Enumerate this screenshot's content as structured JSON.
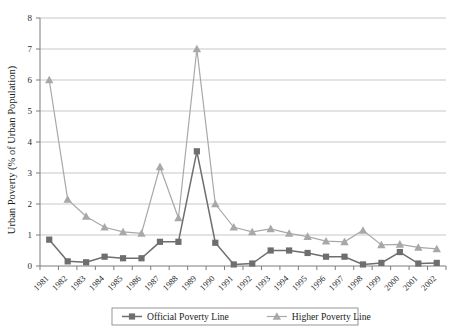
{
  "chart_data": {
    "type": "line",
    "title": "",
    "xlabel": "",
    "ylabel": "Urban Poverty (% of Urban Population)",
    "ylim": [
      0,
      8
    ],
    "ytick_labels": [
      "0",
      "1",
      "2",
      "3",
      "4",
      "5",
      "6",
      "7",
      "8"
    ],
    "grid": true,
    "legend_position": "bottom",
    "categories": [
      "1981",
      "1982",
      "1983",
      "1984",
      "1985",
      "1986",
      "1987",
      "1988",
      "1989",
      "1990",
      "1991",
      "1992",
      "1993",
      "1994",
      "1995",
      "1996",
      "1997",
      "1998",
      "1999",
      "2000",
      "2001",
      "2002"
    ],
    "series": [
      {
        "name": "Official Poverty Line",
        "marker": "square",
        "color": "#6e6e6e",
        "values": [
          0.85,
          0.15,
          0.12,
          0.3,
          0.25,
          0.25,
          0.78,
          0.78,
          3.7,
          0.75,
          0.05,
          0.08,
          0.5,
          0.5,
          0.42,
          0.3,
          0.3,
          0.05,
          0.1,
          0.45,
          0.08,
          0.1
        ]
      },
      {
        "name": "Higher Poverty Line",
        "marker": "triangle",
        "color": "#a8a8a8",
        "values": [
          6.0,
          2.15,
          1.6,
          1.25,
          1.1,
          1.05,
          3.2,
          1.55,
          7.0,
          2.0,
          1.25,
          1.1,
          1.2,
          1.05,
          0.95,
          0.8,
          0.78,
          1.15,
          0.68,
          0.7,
          0.6,
          0.55
        ]
      }
    ]
  },
  "legend": {
    "items": [
      {
        "label": "Official Poverty Line",
        "marker": "square",
        "color": "#6e6e6e"
      },
      {
        "label": "Higher Poverty Line",
        "marker": "triangle",
        "color": "#a8a8a8"
      }
    ]
  },
  "axes": {
    "y_axis_title": "Urban Poverty (% of Urban Population)"
  }
}
